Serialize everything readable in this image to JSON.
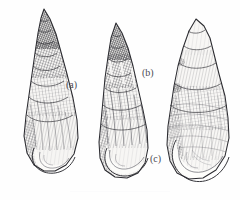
{
  "plate": {
    "kind": "scientific-illustration-plate",
    "background_color": "#fefefe",
    "ink_color": "#3a3a3e",
    "subject": "gastropod shells",
    "label_color": "#4a4a52"
  },
  "figures": [
    {
      "id": "a",
      "label": "(a)",
      "name": "shell-a",
      "description": "tall slender turreted shell, dark hatched apex, many whorls",
      "whorl_count": 10,
      "bounds": {
        "x": 22,
        "y": 8,
        "width": 60,
        "height": 164
      },
      "label_position": {
        "x": 66,
        "y": 80
      }
    },
    {
      "id": "b",
      "label": "(b)",
      "name": "shell-b",
      "description": "medium elongate shell, dark spire, broad body whorl and aperture",
      "whorl_count": 8,
      "bounds": {
        "x": 98,
        "y": 22,
        "width": 52,
        "height": 156
      },
      "label_position": {
        "x": 142,
        "y": 68
      }
    },
    {
      "id": "c",
      "label": "(c)",
      "name": "shell-c",
      "description": "broad stout shell, very large inflated body whorl, short spire",
      "whorl_count": 6,
      "bounds": {
        "x": 166,
        "y": 18,
        "width": 64,
        "height": 162
      },
      "label_position": {
        "x": 150,
        "y": 154
      }
    }
  ]
}
